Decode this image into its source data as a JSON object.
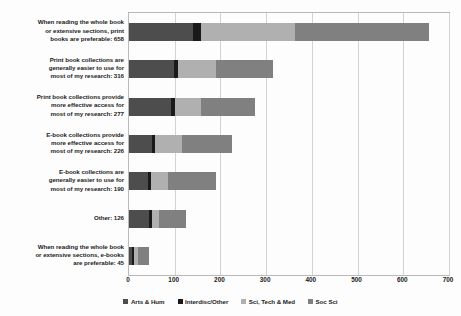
{
  "chart_data": {
    "type": "bar",
    "subtype": "horizontal-stacked-bar",
    "title": "",
    "xlabel": "",
    "ylabel": "",
    "xlim": [
      0,
      700
    ],
    "xticks": [
      0,
      100,
      200,
      300,
      400,
      500,
      600,
      700
    ],
    "grid": true,
    "legend_position": "bottom",
    "orientation": "horizontal",
    "stacked": true,
    "categories": [
      "When reading the whole book\nor extensive sections, print\nbooks are preferable: 658",
      "Print book collections are\ngenerally easier to use for\nmost of my research: 316",
      "Print book collections provide\nmore effective access for\nmost of my research: 277",
      "E-book collections provide\nmore effective access for\nmost of my research: 226",
      "E-book collections are\ngenerally easier to use for\nmost of my research: 190",
      "Other: 126",
      "When reading the whole book\nor extensive sections, e-books\nare preferable: 45"
    ],
    "totals": [
      658,
      316,
      277,
      226,
      190,
      126,
      45
    ],
    "series": [
      {
        "name": "Arts & Hum",
        "color": "#4d4d4d",
        "values": [
          140,
          98,
          92,
          50,
          42,
          44,
          7
        ]
      },
      {
        "name": "Interdisc/Other",
        "color": "#1a1a1a",
        "values": [
          18,
          9,
          9,
          7,
          6,
          6,
          4
        ]
      },
      {
        "name": "Sci, Tech & Med",
        "color": "#b0b0b0",
        "values": [
          206,
          83,
          57,
          59,
          37,
          15,
          9
        ]
      },
      {
        "name": "Soc Sci",
        "color": "#808080",
        "values": [
          293,
          125,
          118,
          109,
          105,
          59,
          24
        ]
      }
    ]
  },
  "legend": {
    "items": [
      {
        "label": "Arts & Hum",
        "color": "#4d4d4d"
      },
      {
        "label": "Interdisc/Other",
        "color": "#1a1a1a"
      },
      {
        "label": "Sci, Tech & Med",
        "color": "#b0b0b0"
      },
      {
        "label": "Soc Sci",
        "color": "#808080"
      }
    ]
  },
  "axis": {
    "x_tick_labels": [
      "0",
      "100",
      "200",
      "300",
      "400",
      "500",
      "600",
      "700"
    ]
  },
  "colors": {
    "plot_border": "#b9b9b9",
    "gridline": "#d2d2d2",
    "background": "#fdfdfd",
    "text": "#1c1c1c"
  }
}
